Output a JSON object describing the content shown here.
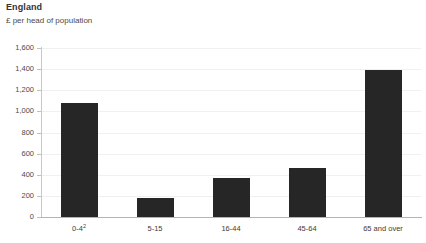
{
  "chart_data": {
    "type": "bar",
    "title": "England",
    "subtitle": "£ per head of population",
    "xlabel": "",
    "ylabel": "",
    "categories": [
      "0-4",
      "5-15",
      "16-44",
      "45-64",
      "65 and over"
    ],
    "category_footnotes": [
      "2",
      "",
      "",
      "",
      ""
    ],
    "values": [
      1080,
      180,
      370,
      465,
      1390
    ],
    "ylim": [
      0,
      1600
    ],
    "yticks": [
      0,
      200,
      400,
      600,
      800,
      1000,
      1200,
      1400,
      1600
    ],
    "ytick_labels": [
      "0",
      "200",
      "400",
      "600",
      "800",
      "1,000",
      "1,200",
      "1,400",
      "1,600"
    ],
    "grid": true,
    "legend": false,
    "bar_color": "#262626",
    "background_color": "#ffffff",
    "gridline_color": "#f0f0f0",
    "axis_color": "#b4b4b4"
  }
}
